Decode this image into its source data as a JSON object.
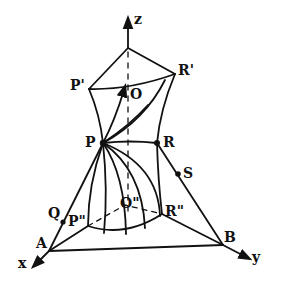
{
  "diagram": {
    "axes": {
      "x": "x",
      "y": "y",
      "z": "z"
    },
    "points": {
      "O": "O",
      "O_dprime": "O\"",
      "P": "P",
      "P_prime": "P'",
      "P_dprime": "P\"",
      "R": "R",
      "R_prime": "R'",
      "R_dprime": "R\"",
      "Q": "Q",
      "S": "S",
      "A": "A",
      "B": "B"
    },
    "colors": {
      "ink": "#111111",
      "background": "#ffffff"
    }
  }
}
